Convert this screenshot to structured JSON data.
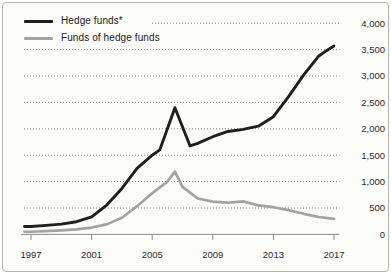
{
  "chart_data": {
    "type": "line",
    "xlabel": "",
    "ylabel": "",
    "xlim": [
      1997,
      2017
    ],
    "ylim": [
      0,
      4000
    ],
    "grid": "dotted-horizontal",
    "y_axis_side": "right",
    "legend_position": "top-left",
    "x_ticks": [
      1997,
      2001,
      2005,
      2009,
      2013,
      2017
    ],
    "x_tick_labels": [
      "1997",
      "2001",
      "2005",
      "2009",
      "2013",
      "2017"
    ],
    "y_ticks": [
      0,
      500,
      1000,
      1500,
      2000,
      2500,
      3000,
      3500,
      4000
    ],
    "y_tick_labels": [
      "0",
      "500",
      "1,000",
      "1,500",
      "2,000",
      "2,500",
      "3,000",
      "3,500",
      "4,000"
    ],
    "series": [
      {
        "name": "Hedge funds*",
        "color": "#1f1f1f",
        "points": [
          [
            1997,
            150
          ],
          [
            1998,
            170
          ],
          [
            1999,
            195
          ],
          [
            2000,
            240
          ],
          [
            2001,
            330
          ],
          [
            2002,
            555
          ],
          [
            2003,
            870
          ],
          [
            2004,
            1250
          ],
          [
            2005,
            1500
          ],
          [
            2005.5,
            1600
          ],
          [
            2006.5,
            2400
          ],
          [
            2007.5,
            1675
          ],
          [
            2008,
            1725
          ],
          [
            2009,
            1850
          ],
          [
            2010,
            1950
          ],
          [
            2011,
            1990
          ],
          [
            2012,
            2050
          ],
          [
            2013,
            2230
          ],
          [
            2014,
            2610
          ],
          [
            2015,
            3020
          ],
          [
            2016,
            3380
          ],
          [
            2016.5,
            3480
          ],
          [
            2017,
            3570
          ]
        ]
      },
      {
        "name": "Funds of hedge funds",
        "color": "#a3a3a3",
        "points": [
          [
            1997,
            50
          ],
          [
            1998,
            62
          ],
          [
            1999,
            78
          ],
          [
            2000,
            95
          ],
          [
            2001,
            130
          ],
          [
            2002,
            190
          ],
          [
            2003,
            315
          ],
          [
            2004,
            535
          ],
          [
            2005,
            780
          ],
          [
            2006,
            1000
          ],
          [
            2006.5,
            1190
          ],
          [
            2007,
            900
          ],
          [
            2007.5,
            790
          ],
          [
            2008,
            680
          ],
          [
            2009,
            620
          ],
          [
            2010,
            600
          ],
          [
            2011,
            625
          ],
          [
            2012,
            550
          ],
          [
            2013,
            515
          ],
          [
            2014,
            460
          ],
          [
            2015,
            390
          ],
          [
            2016,
            330
          ],
          [
            2017,
            295
          ]
        ]
      }
    ],
    "colors": {
      "gridline": "#7f7f7f",
      "axis": "#8c8c8c",
      "tick_label": "#2b2b2b",
      "background": "#fcfcf9",
      "frame_border": "#b3b3b0"
    }
  }
}
